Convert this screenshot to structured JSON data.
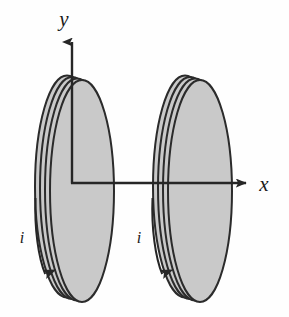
{
  "figure": {
    "background_color": "#fefefe",
    "line_color": "#262626",
    "coil_fill_color": "#c9c9c9",
    "coil_stroke_color": "#2b2b2b"
  },
  "axes": {
    "origin": {
      "x": 72,
      "y": 183
    },
    "y_axis": {
      "label": "y",
      "label_position": {
        "x": 64,
        "y": 26
      },
      "from": {
        "x": 72,
        "y": 183
      },
      "to": {
        "x": 72,
        "y": 33
      },
      "arrowhead": "up"
    },
    "x_axis": {
      "label": "x",
      "label_position": {
        "x": 262,
        "y": 190
      },
      "from": {
        "x": 72,
        "y": 183
      },
      "to": {
        "x": 256,
        "y": 183
      },
      "arrowhead": "right"
    }
  },
  "coils": [
    {
      "name": "left-coil",
      "center": {
        "x": 82,
        "y": 191
      },
      "radius_x": 32,
      "radius_y": 111,
      "turns": 4,
      "turn_offset_x": -5.0,
      "turn_offset_y": -1.5,
      "fill": "#c9c9c9"
    },
    {
      "name": "right-coil",
      "center": {
        "x": 200,
        "y": 191
      },
      "radius_x": 32,
      "radius_y": 111,
      "turns": 4,
      "turn_offset_x": -5.0,
      "turn_offset_y": -1.5,
      "fill": "#c9c9c9"
    }
  ],
  "current_arrows": [
    {
      "name": "left-current-arrow",
      "label": "i",
      "label_position": {
        "x": 22,
        "y": 240
      },
      "arrow_start": {
        "x": 36,
        "y": 198
      },
      "arrow_end": {
        "x": 46,
        "y": 283
      },
      "direction": "downward"
    },
    {
      "name": "right-current-arrow",
      "label": "i",
      "label_position": {
        "x": 139,
        "y": 240
      },
      "arrow_start": {
        "x": 153,
        "y": 198
      },
      "arrow_end": {
        "x": 163,
        "y": 283
      },
      "direction": "downward"
    }
  ]
}
